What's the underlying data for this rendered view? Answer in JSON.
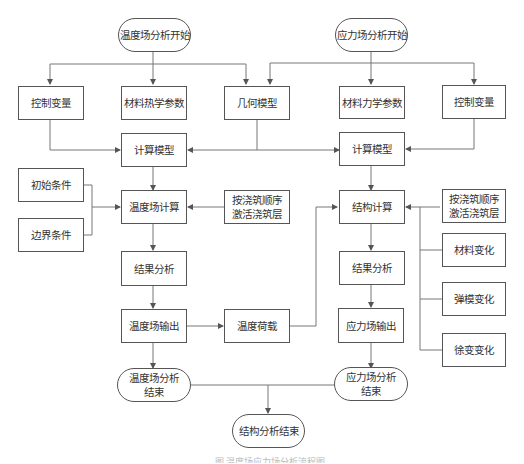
{
  "nodes": {
    "temp_start": "温度场分析开始",
    "stress_start": "应力场分析开始",
    "control_var_left": "控制变量",
    "thermal_params": "材料热学参数",
    "geometry_model": "几何模型",
    "mech_params": "材料力学参数",
    "control_var_right": "控制变量",
    "calc_model_left": "计算模型",
    "calc_model_right": "计算模型",
    "initial_cond": "初始条件",
    "boundary_cond": "边界条件",
    "temp_calc": "温度场计算",
    "pour_seq_left": "按浇筑顺序\n激活浇筑层",
    "struct_calc": "结构计算",
    "pour_seq_right": "按浇筑顺序\n激活浇筑层",
    "material_change": "材料变化",
    "modulus_change": "弹模变化",
    "creep_change": "徐变变化",
    "result_analysis_left": "结果分析",
    "result_analysis_right": "结果分析",
    "temp_output": "温度场输出",
    "temp_load": "温度荷载",
    "stress_output": "应力场输出",
    "temp_end": "温度场分析\n结束",
    "stress_end": "应力场分析\n结束",
    "struct_end": "结构分析结束"
  },
  "caption": "图 温度场应力场分析流程图",
  "colors": {
    "line": "#666666",
    "border": "#555555",
    "text": "#333333"
  }
}
